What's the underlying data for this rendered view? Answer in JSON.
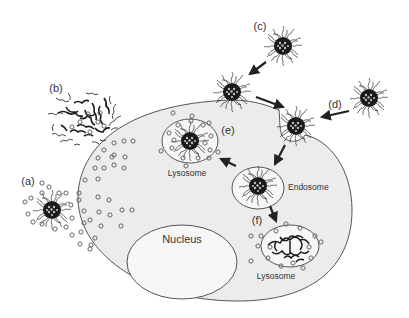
{
  "diagram": {
    "type": "cell-uptake-pathway",
    "colors": {
      "cell_fill": "#ececec",
      "outline": "#555555",
      "particle_core": "#1a1a1a",
      "arrow": "#222222",
      "drug_dot": "#777777",
      "background": "#ffffff"
    },
    "labels": {
      "a": "(a)",
      "b": "(b)",
      "c": "(c)",
      "d": "(d)",
      "e": "(e)",
      "f": "(f)"
    },
    "organelles": {
      "nucleus": "Nucleus",
      "endosome": "Endosome",
      "lysosome_e": "Lysosome",
      "lysosome_f": "Lysosome"
    },
    "nodes": [
      {
        "id": "a",
        "description": "micelle releasing drug outside the cell"
      },
      {
        "id": "b",
        "description": "disassembled polymer aggregate releasing drug at membrane"
      },
      {
        "id": "c",
        "description": "free micelle approaching cell"
      },
      {
        "id": "d",
        "description": "micelle undergoing endocytosis"
      },
      {
        "id": "e",
        "description": "micelle in lysosome releasing drug"
      },
      {
        "id": "f",
        "description": "degraded micelle in lysosome releasing drug"
      }
    ],
    "edges": [
      {
        "from": "c",
        "to": "membrane-particle"
      },
      {
        "from": "membrane-particle",
        "to": "endocytosis-pit"
      },
      {
        "from": "d",
        "to": "endocytosis-pit"
      },
      {
        "from": "endocytosis-pit",
        "to": "endosome"
      },
      {
        "from": "endosome",
        "to": "lysosome_e"
      },
      {
        "from": "endosome",
        "to": "lysosome_f"
      }
    ]
  }
}
